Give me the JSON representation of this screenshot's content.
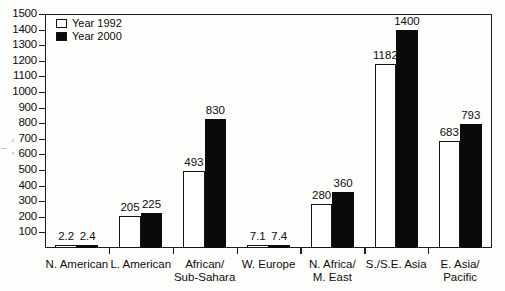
{
  "chart_data": {
    "type": "bar",
    "title": "",
    "subtitle": "",
    "xlabel": "",
    "ylabel": "",
    "ylim": [
      0,
      1500
    ],
    "ytick_labels": [
      "100",
      "200",
      "300",
      "400",
      "500",
      "600",
      "700",
      "800",
      "900",
      "1000",
      "1100",
      "1200",
      "1300",
      "1400",
      "1500"
    ],
    "ytick_values": [
      100,
      200,
      300,
      400,
      500,
      600,
      700,
      800,
      900,
      1000,
      1100,
      1200,
      1300,
      1400,
      1500
    ],
    "grid": false,
    "legend_position": "top-left",
    "categories": [
      "N. American",
      "L. American",
      "African/\nSub-Sahara",
      "W. Europe",
      "N. Africa/\nM. East",
      "S./S.E. Asia",
      "E. Asia/\nPacific"
    ],
    "category_lines": [
      [
        "N. American"
      ],
      [
        "L. American"
      ],
      [
        "African/",
        "Sub-Sahara"
      ],
      [
        "W. Europe"
      ],
      [
        "N. Africa/",
        "M. East"
      ],
      [
        "S./S.E. Asia"
      ],
      [
        "E. Asia/",
        "Pacific"
      ]
    ],
    "series": [
      {
        "name": "Year 1992",
        "color": "#ffffff",
        "edge_color": "#141414",
        "values": [
          2.2,
          205,
          493,
          7.1,
          280,
          1182,
          683
        ],
        "labels": [
          "2.2",
          "205",
          "493",
          "7.1",
          "280",
          "1182",
          "683"
        ]
      },
      {
        "name": "Year 2000",
        "color": "#0a0a0a",
        "edge_color": "#0a0a0a",
        "values": [
          2.4,
          225,
          830,
          7.4,
          360,
          1400,
          793
        ],
        "labels": [
          "2.4",
          "225",
          "830",
          "7.4",
          "360",
          "1400",
          "793"
        ]
      }
    ]
  },
  "legend": {
    "items": [
      {
        "label": "Year 1992",
        "swatch": "white-square"
      },
      {
        "label": "Year 2000",
        "swatch": "black-square"
      }
    ]
  },
  "colors": {
    "background": "#fdfdfb",
    "axis": "#1c1c1c",
    "text": "#0d0d0d",
    "series_1992": "#ffffff",
    "series_2000": "#0a0a0a"
  }
}
